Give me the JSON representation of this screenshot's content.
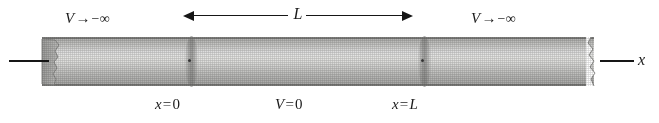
{
  "figure": {
    "axis_label": "x",
    "background_color": "#ffffff",
    "ink_color": "#161616",
    "tube_color": "#c9c9c7"
  },
  "labels": {
    "potential_left": {
      "symbol": "V",
      "arrow": "→",
      "value": "−∞"
    },
    "potential_right": {
      "symbol": "V",
      "arrow": "→",
      "value": "−∞"
    },
    "left_boundary": {
      "symbol": "x",
      "op": "=",
      "value": "0"
    },
    "potential_inside": {
      "symbol": "V",
      "op": "=",
      "value": "0"
    },
    "right_boundary": {
      "symbol": "x",
      "op": "=",
      "value": "L"
    },
    "axis": "x"
  },
  "dimension": {
    "label": "L",
    "description": "well width between x = 0 and x = L",
    "arrow_style": "double-headed"
  },
  "regions": [
    {
      "name": "left-region",
      "potential": "V → −∞"
    },
    {
      "name": "well-region",
      "potential": "V = 0"
    },
    {
      "name": "right-region",
      "potential": "V → −∞"
    }
  ]
}
